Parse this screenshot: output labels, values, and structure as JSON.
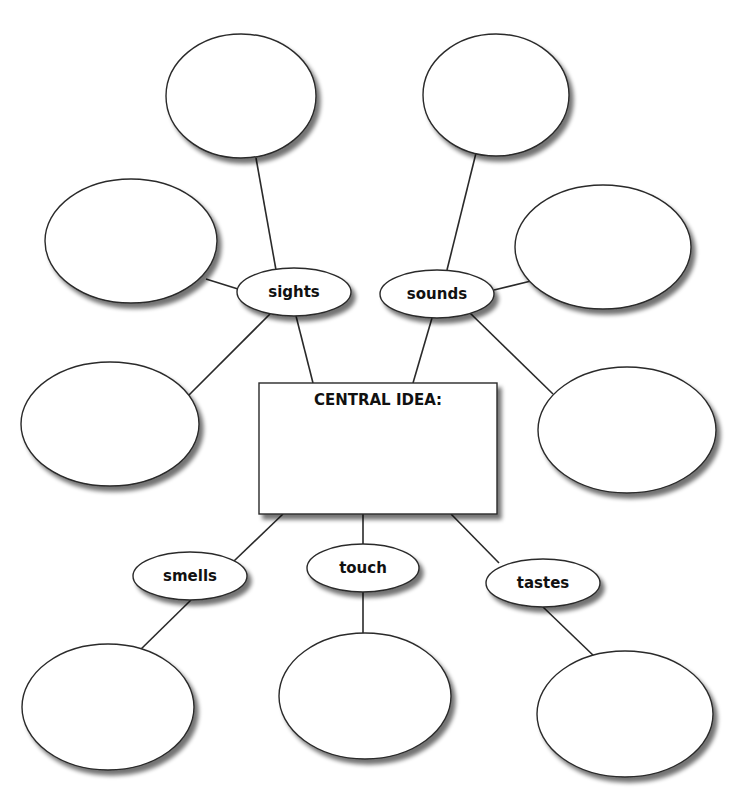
{
  "central": {
    "title": "CENTRAL IDEA:",
    "box": {
      "x": 259,
      "y": 383,
      "w": 238,
      "h": 131
    }
  },
  "categories": [
    {
      "id": "sights",
      "label": "sights",
      "cx": 294,
      "cy": 292,
      "rx": 57,
      "ry": 24
    },
    {
      "id": "sounds",
      "label": "sounds",
      "cx": 437,
      "cy": 294,
      "rx": 57,
      "ry": 24
    },
    {
      "id": "smells",
      "label": "smells",
      "cx": 190,
      "cy": 576,
      "rx": 57,
      "ry": 24
    },
    {
      "id": "touch",
      "label": "touch",
      "cx": 363,
      "cy": 568,
      "rx": 56,
      "ry": 24
    },
    {
      "id": "tastes",
      "label": "tastes",
      "cx": 543,
      "cy": 583,
      "rx": 57,
      "ry": 24
    }
  ],
  "detail_bubbles": [
    {
      "id": "sights-top",
      "cx": 241,
      "cy": 96,
      "rx": 75,
      "ry": 62
    },
    {
      "id": "sights-left",
      "cx": 131,
      "cy": 241,
      "rx": 86,
      "ry": 62
    },
    {
      "id": "sights-bottom",
      "cx": 110,
      "cy": 424,
      "rx": 89,
      "ry": 62
    },
    {
      "id": "sounds-top",
      "cx": 496,
      "cy": 95,
      "rx": 73,
      "ry": 61
    },
    {
      "id": "sounds-right",
      "cx": 603,
      "cy": 247,
      "rx": 88,
      "ry": 62
    },
    {
      "id": "sounds-bottom",
      "cx": 627,
      "cy": 430,
      "rx": 89,
      "ry": 63
    },
    {
      "id": "smells-bottom",
      "cx": 108,
      "cy": 707,
      "rx": 86,
      "ry": 63
    },
    {
      "id": "touch-bottom",
      "cx": 365,
      "cy": 696,
      "rx": 86,
      "ry": 63
    },
    {
      "id": "tastes-bottom",
      "cx": 625,
      "cy": 714,
      "rx": 88,
      "ry": 63
    }
  ],
  "connectors": [
    {
      "from": "sights",
      "to": "sights-top",
      "x1": 276,
      "y1": 270,
      "x2": 256,
      "y2": 158
    },
    {
      "from": "sights",
      "to": "sights-left",
      "x1": 238,
      "y1": 289,
      "x2": 206,
      "y2": 279
    },
    {
      "from": "sights",
      "to": "sights-bottom",
      "x1": 270,
      "y1": 314,
      "x2": 185,
      "y2": 399
    },
    {
      "from": "sights",
      "to": "central",
      "x1": 296,
      "y1": 316,
      "x2": 313,
      "y2": 383
    },
    {
      "from": "sounds",
      "to": "sounds-top",
      "x1": 447,
      "y1": 270,
      "x2": 476,
      "y2": 153
    },
    {
      "from": "sounds",
      "to": "sounds-right",
      "x1": 494,
      "y1": 290,
      "x2": 531,
      "y2": 281
    },
    {
      "from": "sounds",
      "to": "sounds-bottom",
      "x1": 470,
      "y1": 313,
      "x2": 553,
      "y2": 394
    },
    {
      "from": "sounds",
      "to": "central",
      "x1": 432,
      "y1": 318,
      "x2": 413,
      "y2": 383
    },
    {
      "from": "central",
      "to": "smells",
      "x1": 283,
      "y1": 514,
      "x2": 234,
      "y2": 561
    },
    {
      "from": "central",
      "to": "touch",
      "x1": 363,
      "y1": 514,
      "x2": 363,
      "y2": 544
    },
    {
      "from": "central",
      "to": "tastes",
      "x1": 451,
      "y1": 514,
      "x2": 499,
      "y2": 563
    },
    {
      "from": "smells",
      "to": "smells-bottom",
      "x1": 191,
      "y1": 600,
      "x2": 137,
      "y2": 653
    },
    {
      "from": "touch",
      "to": "touch-bottom",
      "x1": 363,
      "y1": 592,
      "x2": 363,
      "y2": 633
    },
    {
      "from": "tastes",
      "to": "tastes-bottom",
      "x1": 543,
      "y1": 607,
      "x2": 596,
      "y2": 658
    }
  ],
  "style": {
    "stroke": "#2a2a2a",
    "fill": "#ffffff",
    "shadow": "#9a9a9a"
  }
}
